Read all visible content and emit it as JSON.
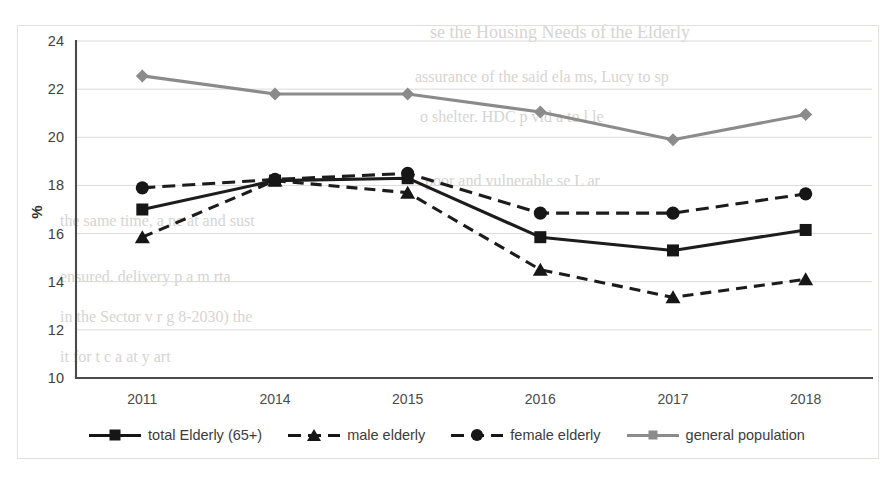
{
  "chart_data": {
    "type": "line",
    "title": "",
    "xlabel": "",
    "ylabel": "%",
    "categories": [
      "2011",
      "2014",
      "2015",
      "2016",
      "2017",
      "2018"
    ],
    "ylim": [
      10,
      24
    ],
    "yticks": [
      10,
      12,
      14,
      16,
      18,
      20,
      22,
      24
    ],
    "grid": true,
    "legend_position": "bottom",
    "series": [
      {
        "name": "total Elderly (65+)",
        "style": "solid",
        "marker": "square",
        "color": "#161616",
        "values": [
          17.0,
          18.2,
          18.3,
          15.85,
          15.3,
          16.15
        ]
      },
      {
        "name": "male elderly",
        "style": "dashed",
        "marker": "triangle",
        "color": "#161616",
        "values": [
          15.85,
          18.2,
          17.7,
          14.5,
          13.35,
          14.1
        ]
      },
      {
        "name": "female elderly",
        "style": "dashed",
        "marker": "circle",
        "color": "#161616",
        "values": [
          17.9,
          18.25,
          18.5,
          16.85,
          16.85,
          17.65
        ]
      },
      {
        "name": "general population",
        "style": "solid",
        "marker": "diamond",
        "color": "#8b8b8b",
        "values": [
          22.55,
          21.8,
          21.8,
          21.05,
          19.9,
          20.95
        ]
      }
    ]
  },
  "legend": {
    "items": [
      {
        "label": "total Elderly (65+)",
        "icon": "solid-line-square-marker"
      },
      {
        "label": "male elderly",
        "icon": "dashed-line-triangle-marker"
      },
      {
        "label": "female elderly",
        "icon": "dashed-line-circle-marker"
      },
      {
        "label": "general population",
        "icon": "solid-line-diamond-marker"
      }
    ]
  },
  "bleed_through": {
    "lines": [
      "se the Housing Needs of the Elderly",
      "assurance of the said ela  ms, Lucy to sp",
      "o shelter. HDC  p vid   a  to   l       le",
      "poor and vulnerable   se  L   ar",
      "the same time,   a  ne     at  and sust",
      "ensured.  delivery  p    a   m   rta",
      "in the Sector  v   r   g   8-2030) the",
      "it for t    c  a    at    y  art"
    ]
  }
}
